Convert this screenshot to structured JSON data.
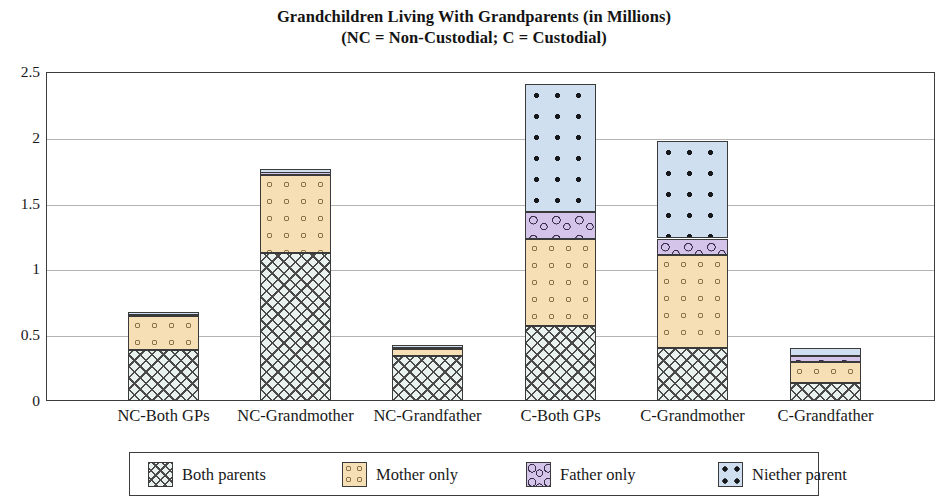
{
  "chart_data": {
    "type": "bar",
    "stacked": true,
    "title": "Grandchildren Living With Grandparents (in Millions)",
    "subtitle": "(NC = Non-Custodial; C = Custodial)",
    "xlabel": "",
    "ylabel": "",
    "ylim": [
      0,
      2.5
    ],
    "yticks": [
      "0",
      "0.5",
      "1",
      "1.5",
      "2",
      "2.5"
    ],
    "ytick_values": [
      0,
      0.5,
      1,
      1.5,
      2,
      2.5
    ],
    "grid": true,
    "legend_position": "bottom",
    "categories": [
      "NC-Both GPs",
      "NC-Grandmother",
      "NC-Grandfather",
      "C-Both GPs",
      "C-Grandmother",
      "C-Grandfather"
    ],
    "series": [
      {
        "name": "Both parents",
        "color": "#e9f2ee",
        "pattern": "crosshatch",
        "values": [
          0.385,
          1.125,
          0.34,
          0.57,
          0.405,
          0.135
        ]
      },
      {
        "name": "Mother only",
        "color": "#f6dfb5",
        "pattern": "small-circles",
        "values": [
          0.26,
          0.59,
          0.055,
          0.66,
          0.705,
          0.165
        ]
      },
      {
        "name": "Father only",
        "color": "#d5c4ea",
        "pattern": "squiggle-blobs",
        "values": [
          0.01,
          0.02,
          0.005,
          0.205,
          0.125,
          0.045
        ]
      },
      {
        "name": "Niether parent",
        "color": "#cfdff0",
        "pattern": "dots",
        "values": [
          0.015,
          0.03,
          0.01,
          0.975,
          0.74,
          0.055
        ]
      }
    ],
    "totals": [
      0.67,
      1.765,
      0.41,
      2.41,
      1.975,
      0.4
    ]
  },
  "title": {
    "line1": "Grandchildren Living With Grandparents (in Millions)",
    "line2": "(NC = Non-Custodial; C = Custodial)"
  },
  "yaxis": {
    "ticks": [
      "2.5",
      "2",
      "1.5",
      "1",
      "0.5",
      "0"
    ]
  },
  "xaxis": {
    "labels": [
      "NC-Both GPs",
      "NC-Grandmother",
      "NC-Grandfather",
      "C-Both GPs",
      "C-Grandmother",
      "C-Grandfather"
    ]
  },
  "legend": {
    "items": [
      {
        "label": "Both parents"
      },
      {
        "label": "Mother only"
      },
      {
        "label": "Father only"
      },
      {
        "label": "Niether parent"
      }
    ]
  }
}
